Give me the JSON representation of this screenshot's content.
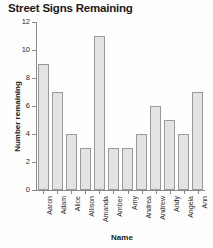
{
  "chart_data": {
    "type": "bar",
    "title": "Street Signs Remaining",
    "xlabel": "Name",
    "ylabel": "Number remaining",
    "categories": [
      "Aaron",
      "Adam",
      "Alice",
      "Allison",
      "Amanda",
      "Amber",
      "Amy",
      "Andrea",
      "Andrew",
      "Andy",
      "Angela",
      "Ann"
    ],
    "values": [
      9,
      7,
      4,
      3,
      11,
      3,
      3,
      4,
      6,
      5,
      4,
      7
    ],
    "ylim": [
      0,
      12
    ],
    "yticks": [
      0,
      2,
      4,
      6,
      8,
      10,
      12
    ],
    "ytick_labels": [
      "0",
      "2",
      "4",
      "6",
      "8",
      "10",
      "12"
    ],
    "grid": false,
    "legend": false,
    "bar_color": "#e3e3e3",
    "bar_edge_color": "#9a9a9a",
    "axis_color": "#8a8a8a",
    "text_color": "#1a1a1a",
    "background": "#fefefe"
  }
}
